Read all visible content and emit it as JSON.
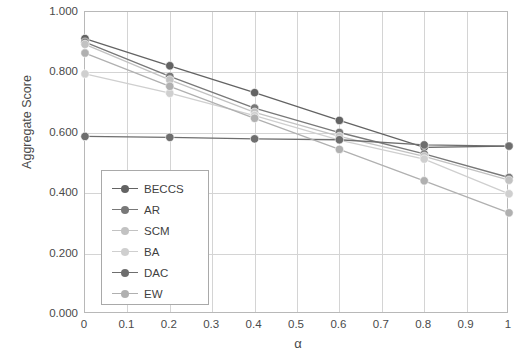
{
  "chart_data": {
    "type": "line",
    "title": "",
    "xlabel": "α",
    "ylabel": "Aggregate Score",
    "xlim": [
      0,
      1
    ],
    "ylim": [
      0,
      1
    ],
    "grid": true,
    "legend_position": "inside-bottom-left",
    "x": [
      0,
      0.2,
      0.4,
      0.6,
      0.8,
      1
    ],
    "xticks": [
      "0",
      "0.1",
      "0.2",
      "0.3",
      "0.4",
      "0.5",
      "0.6",
      "0.7",
      "0.8",
      "0.9",
      "1"
    ],
    "xtick_values": [
      0,
      0.1,
      0.2,
      0.3,
      0.4,
      0.5,
      0.6,
      0.7,
      0.8,
      0.9,
      1
    ],
    "yticks": [
      "0.000",
      "0.200",
      "0.400",
      "0.600",
      "0.800",
      "1.000"
    ],
    "ytick_values": [
      0,
      0.2,
      0.4,
      0.6,
      0.8,
      1
    ],
    "series": [
      {
        "name": "BECCS",
        "color": "#636363",
        "values": [
          0.912,
          0.822,
          0.733,
          0.641,
          0.552,
          0.556
        ]
      },
      {
        "name": "AR",
        "color": "#787878",
        "values": [
          0.9,
          0.787,
          0.682,
          0.601,
          0.53,
          0.452
        ]
      },
      {
        "name": "SCM",
        "color": "#c2c2c2",
        "values": [
          0.893,
          0.775,
          0.668,
          0.588,
          0.522,
          0.443
        ]
      },
      {
        "name": "BA",
        "color": "#cfcfcf",
        "values": [
          0.795,
          0.731,
          0.657,
          0.576,
          0.513,
          0.398
        ]
      },
      {
        "name": "DAC",
        "color": "#6e6e6e",
        "values": [
          0.588,
          0.585,
          0.58,
          0.577,
          0.56,
          0.556
        ]
      },
      {
        "name": "EW",
        "color": "#b0b0b0",
        "values": [
          0.864,
          0.754,
          0.648,
          0.545,
          0.441,
          0.335
        ]
      }
    ]
  },
  "legend": {
    "items": [
      {
        "label": "BECCS"
      },
      {
        "label": "AR"
      },
      {
        "label": "SCM"
      },
      {
        "label": "BA"
      },
      {
        "label": "DAC"
      },
      {
        "label": "EW"
      }
    ]
  },
  "axes": {
    "y_title": "Aggregate Score",
    "x_title": "α"
  }
}
